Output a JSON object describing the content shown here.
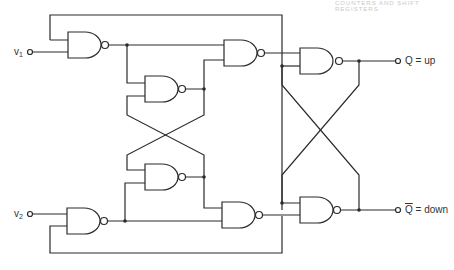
{
  "header": {
    "running_text": "COUNTERS AND SHIFT REGISTERS"
  },
  "diagram": {
    "type": "logic-circuit",
    "inputs": [
      {
        "id": "v1",
        "label": "v",
        "subscript": "1"
      },
      {
        "id": "v2",
        "label": "v",
        "subscript": "2"
      }
    ],
    "outputs": [
      {
        "id": "Q",
        "label": "Q",
        "suffix": " = up"
      },
      {
        "id": "Qbar",
        "label": "Q",
        "overline": true,
        "suffix": " = down"
      }
    ],
    "gates": [
      {
        "id": "A",
        "type": "NAND",
        "inputs": [
          "v1",
          "H-feedback"
        ],
        "output": "a"
      },
      {
        "id": "B",
        "type": "NAND",
        "inputs": [
          "a",
          "F-out"
        ],
        "output": "b"
      },
      {
        "id": "C",
        "type": "NAND",
        "inputs": [
          "a",
          "b"
        ],
        "output": "c"
      },
      {
        "id": "D",
        "type": "NAND",
        "inputs": [
          "c",
          "Qbar"
        ],
        "output": "Q"
      },
      {
        "id": "E",
        "type": "NAND",
        "inputs": [
          "v2",
          "D-feedback"
        ],
        "output": "e"
      },
      {
        "id": "F",
        "type": "NAND",
        "inputs": [
          "B-out",
          "e"
        ],
        "output": "f"
      },
      {
        "id": "G",
        "type": "NAND",
        "inputs": [
          "f",
          "e"
        ],
        "output": "g"
      },
      {
        "id": "H",
        "type": "NAND",
        "inputs": [
          "Q",
          "g"
        ],
        "output": "Qbar"
      }
    ],
    "gate_count": 8
  }
}
